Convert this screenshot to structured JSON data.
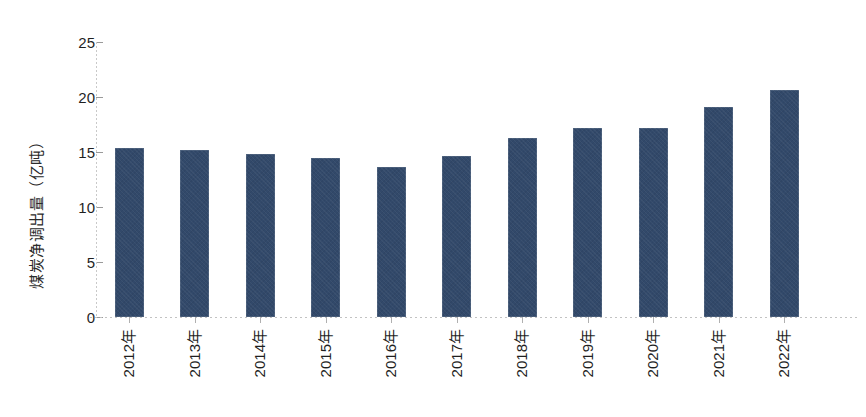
{
  "chart_data": {
    "type": "bar",
    "title": "",
    "subtitle": "",
    "xlabel": "",
    "ylabel": "煤炭净调出量（亿吨）",
    "categories": [
      "2012年",
      "2013年",
      "2014年",
      "2015年",
      "2016年",
      "2017年",
      "2018年",
      "2019年",
      "2020年",
      "2021年",
      "2022年"
    ],
    "values": [
      15.4,
      15.2,
      14.8,
      14.5,
      13.6,
      14.6,
      16.3,
      17.2,
      17.2,
      19.1,
      20.6
    ],
    "ylim": [
      0,
      25
    ],
    "yticks": [
      0,
      5,
      10,
      15,
      20,
      25
    ],
    "ytick_labels": [
      "0",
      "5",
      "10",
      "15",
      "20",
      "25"
    ],
    "grid": false,
    "legend": null,
    "legend_position": "none",
    "series": [
      {
        "name": "煤炭净调出量",
        "values": [
          15.4,
          15.2,
          14.8,
          14.5,
          13.6,
          14.6,
          16.3,
          17.2,
          17.2,
          19.1,
          20.6
        ]
      }
    ],
    "colors": {
      "bar": "#32496a",
      "axis": "#b0b0b0",
      "text": "#1f1f1f",
      "background": "#ffffff"
    }
  }
}
